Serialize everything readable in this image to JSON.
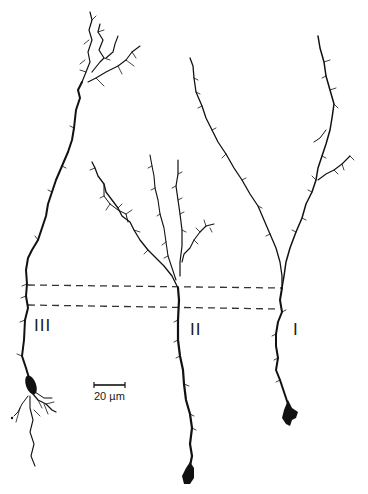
{
  "figure": {
    "type": "camera-lucida neuron drawings",
    "ink_color": "#111111",
    "background": "#ffffff",
    "neurons": [
      {
        "id": "III",
        "label": "III"
      },
      {
        "id": "II",
        "label": "II"
      },
      {
        "id": "I",
        "label": "I"
      }
    ],
    "reference_lines": {
      "count": 2,
      "style": "dashed"
    },
    "scale_bar": {
      "label": "20 µm",
      "value": 20,
      "unit": "µm"
    }
  }
}
